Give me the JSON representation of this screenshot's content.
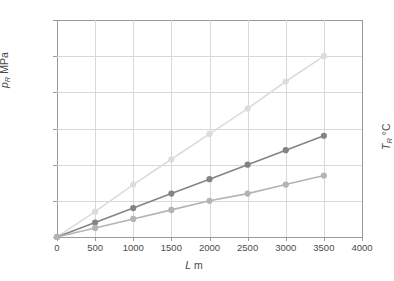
{
  "chart_data": {
    "type": "line",
    "title": "",
    "xlabel": "L m",
    "ylabel": "p_R MPa",
    "y2label": "T_R °C",
    "xlim": [
      0,
      4000
    ],
    "ylim": [
      0,
      120
    ],
    "grid": true,
    "legend": "none",
    "xticks": [
      "0",
      "500",
      "1000",
      "1500",
      "2000",
      "2500",
      "3000",
      "3500",
      "4000"
    ],
    "yticks": [
      "0",
      "20",
      "40",
      "60",
      "80",
      "100",
      "120"
    ],
    "x": [
      0,
      500,
      1000,
      1500,
      2000,
      2500,
      3000,
      3500
    ],
    "series": [
      {
        "name": "series-light",
        "color": "#dcdcdc",
        "marker_color": "#dcdcdc",
        "values": [
          0,
          14,
          29,
          43,
          57,
          71,
          86,
          100
        ]
      },
      {
        "name": "series-dark",
        "color": "#848484",
        "marker_color": "#848484",
        "values": [
          0,
          8,
          16,
          24,
          32,
          40,
          48,
          56
        ]
      },
      {
        "name": "series-mid",
        "color": "#b4b4b4",
        "marker_color": "#b4b4b4",
        "values": [
          0,
          5,
          10,
          15,
          20,
          24,
          29,
          34
        ]
      }
    ]
  },
  "axes": {
    "x_label_var": "L",
    "x_label_unit": "m",
    "y_label_var": "p",
    "y_label_sub": "R",
    "y_label_unit": "MPa",
    "y2_label_var": "T",
    "y2_label_sub": "R",
    "y2_label_unit": "°C"
  },
  "colors": {
    "axis": "#9a9a9a",
    "grid": "#d8d8d8",
    "text": "#4a4a4a",
    "background": "#ffffff"
  }
}
